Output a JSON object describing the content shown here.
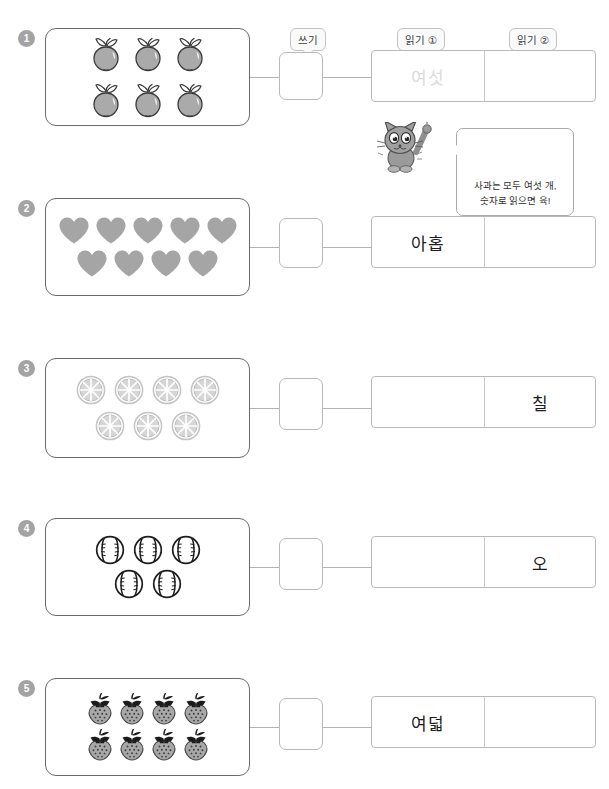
{
  "worksheet": {
    "title": "수 세기 - 쓰기와 읽기 학습지",
    "column_labels": [
      {
        "id": "write",
        "text": "쓰기"
      },
      {
        "id": "read1",
        "text": "읽기 ①"
      },
      {
        "id": "read2",
        "text": "읽기 ②"
      }
    ],
    "hint_character": {
      "name": "cat-mascot",
      "speech": "사과는 모두 여섯 개,\n숫자로 읽으면 육!"
    },
    "colors": {
      "panel_border": "#6b6b6b",
      "box_border": "#b9b9b9",
      "connector": "#b4b4b4",
      "badge_bg": "#a3a3a3",
      "faded_text": "#dadada",
      "text": "#1c1c1c",
      "item_gray": "#a8a8a8"
    },
    "rows": [
      {
        "number": "1",
        "item": "apple",
        "count": 6,
        "grid": [
          3,
          3
        ],
        "write_value": "",
        "read1": {
          "text": "여섯",
          "faded": true
        },
        "read2": {
          "text": "",
          "faded": false
        }
      },
      {
        "number": "2",
        "item": "heart",
        "count": 9,
        "grid": [
          5,
          4
        ],
        "write_value": "",
        "read1": {
          "text": "아홉",
          "faded": false
        },
        "read2": {
          "text": "",
          "faded": false
        }
      },
      {
        "number": "3",
        "item": "orange-slice",
        "count": 7,
        "grid": [
          4,
          3
        ],
        "write_value": "",
        "read1": {
          "text": "",
          "faded": false
        },
        "read2": {
          "text": "칠",
          "faded": false
        }
      },
      {
        "number": "4",
        "item": "baseball",
        "count": 5,
        "grid": [
          3,
          2
        ],
        "write_value": "",
        "read1": {
          "text": "",
          "faded": false
        },
        "read2": {
          "text": "오",
          "faded": false
        }
      },
      {
        "number": "5",
        "item": "strawberry",
        "count": 8,
        "grid": [
          4,
          4
        ],
        "write_value": "",
        "read1": {
          "text": "여덟",
          "faded": false
        },
        "read2": {
          "text": "",
          "faded": false
        }
      }
    ]
  }
}
